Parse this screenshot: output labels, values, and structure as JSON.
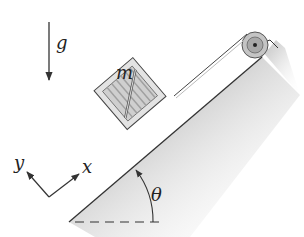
{
  "diagram": {
    "labels": {
      "gravity": "g",
      "mass": "m",
      "x_axis": "x",
      "y_axis": "y",
      "angle": "θ"
    },
    "colors": {
      "line": "#333333",
      "crate_fill": "#d9d9d9",
      "crate_frame": "#bdbdbd",
      "incline_shade": "#9a9a9a",
      "pulley": "#bfbfbf"
    }
  }
}
